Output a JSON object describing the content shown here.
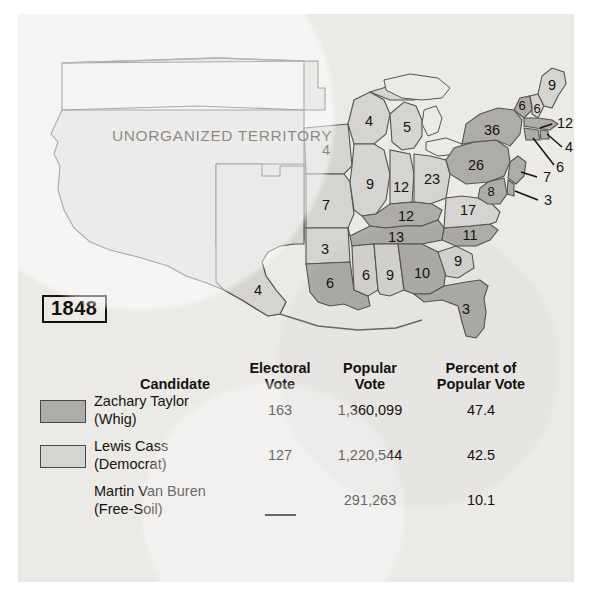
{
  "map": {
    "year_label": "1848",
    "territory_label": "UNORGANIZED TERRITORY",
    "colors": {
      "taylor_fill": "#aeaca8",
      "cass_fill": "#d6d4d0",
      "territory_fill": "#d9d7d3",
      "outline": "#55534f",
      "page_bg": "#eceae7"
    },
    "state_labels": [
      {
        "state": "Maine",
        "votes": "9",
        "winner": "cass"
      },
      {
        "state": "New Hampshire",
        "votes": "6",
        "winner": "cass"
      },
      {
        "state": "Vermont",
        "votes": "6",
        "winner": "taylor"
      },
      {
        "state": "New York",
        "votes": "36",
        "winner": "taylor"
      },
      {
        "state": "Massachusetts",
        "votes": "12",
        "winner": "taylor"
      },
      {
        "state": "Rhode Island",
        "votes": "4",
        "winner": "taylor"
      },
      {
        "state": "Connecticut",
        "votes": "6",
        "winner": "taylor"
      },
      {
        "state": "Pennsylvania",
        "votes": "26",
        "winner": "taylor"
      },
      {
        "state": "New Jersey",
        "votes": "7",
        "winner": "taylor"
      },
      {
        "state": "Maryland",
        "votes": "8",
        "winner": "taylor"
      },
      {
        "state": "Delaware",
        "votes": "3",
        "winner": "taylor"
      },
      {
        "state": "Virginia",
        "votes": "17",
        "winner": "cass"
      },
      {
        "state": "North Carolina",
        "votes": "11",
        "winner": "taylor"
      },
      {
        "state": "South Carolina",
        "votes": "9",
        "winner": "cass"
      },
      {
        "state": "Georgia",
        "votes": "10",
        "winner": "taylor"
      },
      {
        "state": "Florida",
        "votes": "3",
        "winner": "taylor"
      },
      {
        "state": "Alabama",
        "votes": "9",
        "winner": "cass"
      },
      {
        "state": "Mississippi",
        "votes": "6",
        "winner": "cass"
      },
      {
        "state": "Louisiana",
        "votes": "6",
        "winner": "taylor"
      },
      {
        "state": "Texas",
        "votes": "4",
        "winner": "cass"
      },
      {
        "state": "Arkansas",
        "votes": "3",
        "winner": "cass"
      },
      {
        "state": "Missouri",
        "votes": "7",
        "winner": "cass"
      },
      {
        "state": "Iowa",
        "votes": "4",
        "winner": "cass"
      },
      {
        "state": "Wisconsin",
        "votes": "4",
        "winner": "cass"
      },
      {
        "state": "Illinois",
        "votes": "9",
        "winner": "cass"
      },
      {
        "state": "Michigan",
        "votes": "5",
        "winner": "cass"
      },
      {
        "state": "Indiana",
        "votes": "12",
        "winner": "cass"
      },
      {
        "state": "Ohio",
        "votes": "23",
        "winner": "cass"
      },
      {
        "state": "Kentucky",
        "votes": "12",
        "winner": "taylor"
      },
      {
        "state": "Tennessee",
        "votes": "13",
        "winner": "taylor"
      }
    ]
  },
  "table": {
    "headers": {
      "candidate": "Candidate",
      "electoral_vote_l1": "Electoral",
      "electoral_vote_l2": "Vote",
      "popular_vote_l1": "Popular",
      "popular_vote_l2": "Vote",
      "percent_l1": "Percent of",
      "percent_l2": "Popular Vote"
    },
    "rows": [
      {
        "name": "Zachary Taylor",
        "party": "(Whig)",
        "electoral_vote": "163",
        "popular_vote": "1,360,099",
        "percent": "47.4",
        "swatch": "taylor"
      },
      {
        "name": "Lewis Cass",
        "party": "(Democrat)",
        "electoral_vote": "127",
        "popular_vote": "1,220,544",
        "percent": "42.5",
        "swatch": "cass"
      },
      {
        "name": "Martin Van Buren",
        "party": "(Free-Soil)",
        "electoral_vote": "—",
        "popular_vote": "291,263",
        "percent": "10.1",
        "swatch": "none"
      }
    ]
  }
}
